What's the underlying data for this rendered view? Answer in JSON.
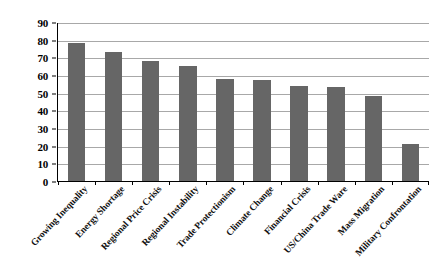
{
  "chart_data": {
    "type": "bar",
    "title": "",
    "subtitle": "",
    "xlabel": "",
    "ylabel": "",
    "ylim": [
      0,
      90
    ],
    "ytick_step": 10,
    "yticks": [
      "90",
      "80",
      "70",
      "60",
      "50",
      "40",
      "30",
      "20",
      "10",
      "0"
    ],
    "grid": true,
    "legend": false,
    "legend_position": "none",
    "bar_color": "#666666",
    "gridline_color": "#a8a8a8",
    "axis_color": "#000000",
    "categories": [
      "Growing Inequality",
      "Energy Shortage",
      "Regional Price Crisis",
      "Regional Instability",
      "Trade Protectionism",
      "Climate Change",
      "Financial Crisis",
      "US/China Trade Ware",
      "Mass Migration",
      "Military Confrontation"
    ],
    "values": [
      78,
      73,
      68,
      65,
      58,
      57,
      54,
      53,
      48,
      21
    ]
  }
}
